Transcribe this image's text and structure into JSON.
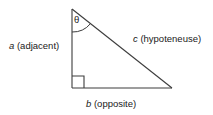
{
  "figure": {
    "type": "right-triangle-trigonometry-diagram",
    "background_color": "#ffffff",
    "stroke_color": "#3c3c3c",
    "text_color": "#1a1a1a",
    "angle_symbol": "θ",
    "labels": {
      "left_side": {
        "variable": "a",
        "parenthetical": "(adjacent)",
        "full": "a (adjacent)"
      },
      "hypotenuse_side": {
        "variable": "c",
        "parenthetical": "(hypoteneuse)",
        "full": "c (hypoteneuse)"
      },
      "bottom_side": {
        "variable": "b",
        "parenthetical": "(opposite)",
        "full": "b (opposite)"
      }
    },
    "vertices": {
      "apex": [
        72,
        9
      ],
      "right_angle": [
        72,
        88
      ],
      "far_corner": [
        172,
        88
      ]
    }
  }
}
